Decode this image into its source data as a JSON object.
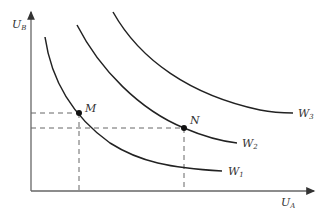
{
  "diagram": {
    "type": "utility-possibility / social indifference curves",
    "y_axis": {
      "label": "U",
      "sub": "B"
    },
    "x_axis": {
      "label": "U",
      "sub": "A"
    },
    "curves": [
      {
        "label": "W",
        "sub": "1"
      },
      {
        "label": "W",
        "sub": "2"
      },
      {
        "label": "W",
        "sub": "3"
      }
    ],
    "points": [
      {
        "label": "M",
        "x": 79,
        "y": 113
      },
      {
        "label": "N",
        "x": 184,
        "y": 128
      }
    ],
    "colors": {
      "axis": "#555555",
      "curve": "#222222",
      "dash": "#666666"
    }
  }
}
